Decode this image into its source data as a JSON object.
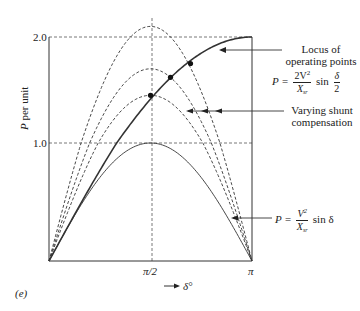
{
  "chart_data": {
    "type": "line",
    "title": "",
    "panel_label": "(e)",
    "xlabel": "δ°",
    "ylabel": "P per unit",
    "x_ticks": [
      "π/2",
      "π"
    ],
    "y_ticks": [
      "1.0",
      "2.0"
    ],
    "xlim": [
      0,
      3.1416
    ],
    "ylim": [
      0,
      2.1
    ],
    "grid": "dashed reference lines at P=1.0, P=2.0 and δ=π/2",
    "series": [
      {
        "name": "P = V²/Xsr sin δ",
        "style": "solid",
        "peak": 1.0
      },
      {
        "name": "shunt compensation 1",
        "style": "dashed",
        "peak": 1.45
      },
      {
        "name": "shunt compensation 2",
        "style": "dashed",
        "peak": 1.7
      },
      {
        "name": "shunt compensation 3",
        "style": "dashed",
        "peak": 2.1
      },
      {
        "name": "Locus of operating points P = 2V²/Xsr sin(δ/2)",
        "style": "solid-bold",
        "peak": 2.0
      }
    ],
    "operating_points": [
      {
        "delta": 1.571,
        "P": 1.45
      },
      {
        "delta": 1.88,
        "P": 1.62
      },
      {
        "delta": 2.19,
        "P": 1.75
      }
    ],
    "annotations": [
      {
        "text": "Locus of operating points",
        "formula": "P = 2V²/Xsr sin δ/2"
      },
      {
        "text": "Varying shunt compensation"
      },
      {
        "formula": "P = V²/Xsr sin δ"
      }
    ]
  },
  "labels": {
    "y_tick_2": "2.0",
    "y_tick_1": "1.0",
    "y_axis_P": "P",
    "y_axis_rest": " per unit",
    "x_tick_half": "π/2",
    "x_tick_pi": "π",
    "x_arrow": "→",
    "x_delta": "δ°",
    "panel": "(e)",
    "locus_line1": "Locus of",
    "locus_line2": "operating points",
    "locus_P": "P =",
    "locus_num": "2V",
    "locus_num_sup": "2",
    "locus_den": "X",
    "locus_den_sub": "sr",
    "locus_sin": "sin",
    "locus_fnum": "δ",
    "locus_fden": "2",
    "shunt_line1": "Varying shunt",
    "shunt_line2": "compensation",
    "base_P": "P =",
    "base_num": "V",
    "base_num_sup": "2",
    "base_den": "X",
    "base_den_sub": "sr",
    "base_sin": "sin δ"
  }
}
